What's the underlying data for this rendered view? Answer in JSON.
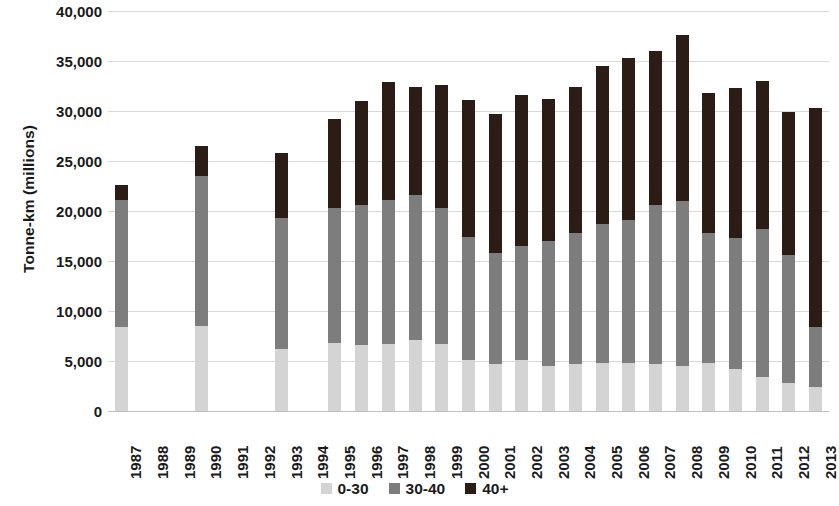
{
  "chart_data": {
    "type": "bar",
    "stacked": true,
    "title": "",
    "subtitle": "",
    "xlabel": "",
    "ylabel": "Tonne-km (millions)",
    "ylim": [
      0,
      40000
    ],
    "ytick_interval": 5000,
    "ytick_labels": [
      "0",
      "5,000",
      "10,000",
      "15,000",
      "20,000",
      "25,000",
      "30,000",
      "35,000",
      "40,000"
    ],
    "ytick_values": [
      0,
      5000,
      10000,
      15000,
      20000,
      25000,
      30000,
      35000,
      40000
    ],
    "grid": true,
    "legend_position": "bottom",
    "colors": {
      "0-30": "#d4d4d4",
      "30-40": "#7d7d7d",
      "40+": "#2b1c16"
    },
    "categories": [
      "1987",
      "1988",
      "1989",
      "1990",
      "1991",
      "1992",
      "1993",
      "1994",
      "1995",
      "1996",
      "1997",
      "1998",
      "1999",
      "2000",
      "2001",
      "2002",
      "2003",
      "2004",
      "2005",
      "2006",
      "2007",
      "2008",
      "2009",
      "2010",
      "2011",
      "2012",
      "2013"
    ],
    "series": [
      {
        "name": "0-30",
        "values": [
          8400,
          null,
          null,
          8500,
          null,
          null,
          6200,
          null,
          6800,
          6600,
          6700,
          7100,
          6700,
          5100,
          4700,
          5100,
          4500,
          4700,
          4800,
          4800,
          4700,
          4500,
          4800,
          4200,
          3400,
          2800,
          2400
        ]
      },
      {
        "name": "30-40",
        "values": [
          12700,
          null,
          null,
          15000,
          null,
          null,
          13100,
          null,
          13500,
          14000,
          14400,
          14500,
          13600,
          12300,
          11100,
          11400,
          12500,
          13100,
          13900,
          14300,
          15900,
          16500,
          13000,
          13100,
          14800,
          12800,
          6000
        ]
      },
      {
        "name": "40+",
        "values": [
          1500,
          null,
          null,
          3000,
          null,
          null,
          6500,
          null,
          8900,
          10400,
          11800,
          10800,
          12300,
          13700,
          13900,
          15100,
          14200,
          14600,
          15800,
          16200,
          15400,
          16600,
          14000,
          15000,
          14800,
          14300,
          21900
        ]
      }
    ],
    "totals": [
      22600,
      null,
      null,
      26500,
      null,
      null,
      25800,
      null,
      29200,
      31000,
      32900,
      32400,
      32600,
      31100,
      29700,
      31600,
      31200,
      32400,
      34500,
      35300,
      36000,
      37600,
      31800,
      32300,
      33000,
      29900,
      30300
    ]
  },
  "legend": {
    "items": [
      {
        "label": "0-30",
        "color": "#d4d4d4"
      },
      {
        "label": "30-40",
        "color": "#7d7d7d"
      },
      {
        "label": "40+",
        "color": "#2b1c16"
      }
    ]
  }
}
